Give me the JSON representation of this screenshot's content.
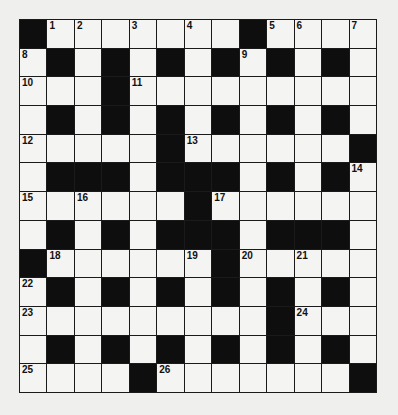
{
  "puzzle": {
    "rows": 13,
    "cols": 13,
    "colors": {
      "black_square": "#0e0e0e",
      "white_square": "#f4f4f2",
      "grid_line": "#1a1a1a",
      "background": "#efefed"
    },
    "layout": [
      "#.......#....",
      ".#.#.#.#.#.#.",
      "...#.........",
      ".#.#.#.#.#.#.",
      ".....#......#",
      ".###.###.#.#.",
      "......#......",
      ".#.#.###.###.",
      "#......#.....",
      ".#.#.#.#.#.#.",
      ".........#...",
      ".#.#.#.#.#.#.",
      "....#.......#"
    ],
    "numbers": [
      {
        "r": 0,
        "c": 1,
        "n": "1"
      },
      {
        "r": 0,
        "c": 2,
        "n": "2"
      },
      {
        "r": 0,
        "c": 4,
        "n": "3"
      },
      {
        "r": 0,
        "c": 6,
        "n": "4"
      },
      {
        "r": 0,
        "c": 9,
        "n": "5"
      },
      {
        "r": 0,
        "c": 10,
        "n": "6"
      },
      {
        "r": 0,
        "c": 12,
        "n": "7"
      },
      {
        "r": 1,
        "c": 0,
        "n": "8"
      },
      {
        "r": 1,
        "c": 8,
        "n": "9"
      },
      {
        "r": 2,
        "c": 0,
        "n": "10"
      },
      {
        "r": 2,
        "c": 4,
        "n": "11"
      },
      {
        "r": 4,
        "c": 0,
        "n": "12"
      },
      {
        "r": 4,
        "c": 6,
        "n": "13"
      },
      {
        "r": 5,
        "c": 12,
        "n": "14"
      },
      {
        "r": 6,
        "c": 0,
        "n": "15"
      },
      {
        "r": 6,
        "c": 2,
        "n": "16"
      },
      {
        "r": 6,
        "c": 7,
        "n": "17"
      },
      {
        "r": 8,
        "c": 1,
        "n": "18"
      },
      {
        "r": 8,
        "c": 6,
        "n": "19"
      },
      {
        "r": 8,
        "c": 8,
        "n": "20"
      },
      {
        "r": 8,
        "c": 10,
        "n": "21"
      },
      {
        "r": 9,
        "c": 0,
        "n": "22"
      },
      {
        "r": 10,
        "c": 0,
        "n": "23"
      },
      {
        "r": 10,
        "c": 10,
        "n": "24"
      },
      {
        "r": 12,
        "c": 0,
        "n": "25"
      },
      {
        "r": 12,
        "c": 5,
        "n": "26"
      }
    ],
    "entries": {}
  }
}
